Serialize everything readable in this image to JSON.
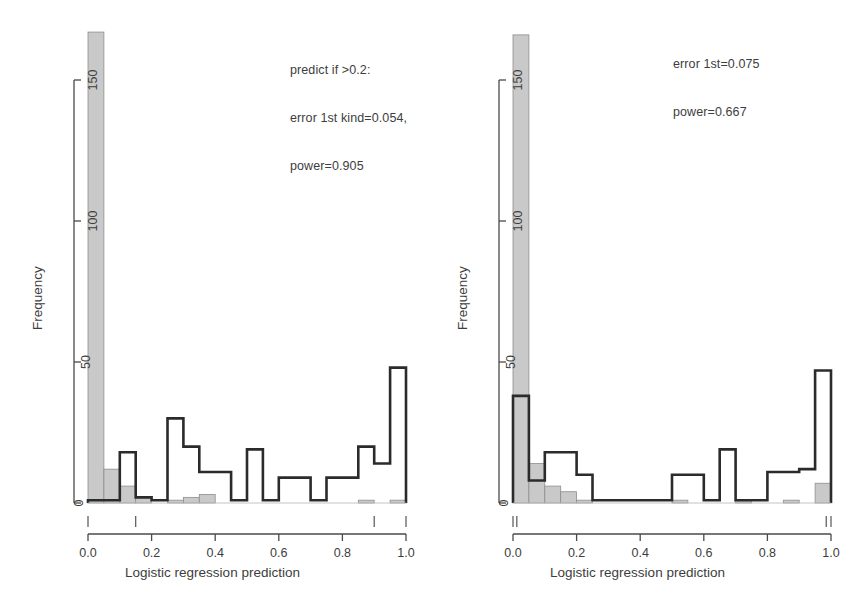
{
  "figure": {
    "width": 850,
    "height": 616,
    "background": "#ffffff",
    "outline_color": "#2b2b2b",
    "fill_color": "#c9c9c9",
    "text_color": "#3d3d3d"
  },
  "panels": [
    {
      "id": "left",
      "xlabel": "Logistic regression prediction",
      "ylabel": "Frequency",
      "annotation_lines": [
        "predict if >0.2:",
        "error 1st kind=0.054,",
        "power=0.905"
      ],
      "xticks": [
        "0.0",
        "0.2",
        "0.4",
        "0.6",
        "0.8",
        "1.0"
      ],
      "yticks": [
        "0",
        "50",
        "100",
        "150"
      ]
    },
    {
      "id": "right",
      "xlabel": "Logistic regression prediction",
      "ylabel": "Frequency",
      "annotation_lines": [
        "error 1st=0.075",
        "power=0.667"
      ],
      "xticks": [
        "0.0",
        "0.2",
        "0.4",
        "0.6",
        "0.8",
        "1.0"
      ],
      "yticks": [
        "0",
        "50",
        "100",
        "150"
      ]
    }
  ],
  "chart_data": [
    {
      "type": "bar",
      "panel": "left",
      "title": "",
      "xlabel": "Logistic regression prediction",
      "ylabel": "Frequency",
      "xlim": [
        0.0,
        1.0
      ],
      "ylim": [
        0,
        170
      ],
      "xticks": [
        0.0,
        0.2,
        0.4,
        0.6,
        0.8,
        1.0
      ],
      "yticks": [
        0,
        50,
        100,
        150
      ],
      "grid": false,
      "legend": "none",
      "bin_width": 0.05,
      "bin_starts": [
        0.0,
        0.05,
        0.1,
        0.15,
        0.2,
        0.25,
        0.3,
        0.35,
        0.4,
        0.45,
        0.5,
        0.55,
        0.6,
        0.65,
        0.7,
        0.75,
        0.8,
        0.85,
        0.9,
        0.95
      ],
      "series": [
        {
          "name": "negatives (grey filled)",
          "style": "filled-grey",
          "values": [
            167,
            12,
            6,
            2,
            0,
            1,
            2,
            3,
            0,
            0,
            0,
            0,
            0,
            0,
            0,
            0,
            0,
            1,
            0,
            1
          ]
        },
        {
          "name": "positives (black outline)",
          "style": "outline-black",
          "values": [
            1,
            1,
            18,
            2,
            1,
            30,
            20,
            11,
            11,
            1,
            19,
            1,
            9,
            9,
            1,
            9,
            9,
            20,
            14,
            48
          ]
        }
      ],
      "rug_marks": [
        0.0,
        0.15,
        0.9,
        1.0
      ],
      "annotations": [
        {
          "text": "predict if >0.2:",
          "x": 0.44,
          "y": 162
        },
        {
          "text": "error 1st kind=0.054,",
          "x": 0.44,
          "y": 155
        },
        {
          "text": "power=0.905",
          "x": 0.44,
          "y": 148
        }
      ]
    },
    {
      "type": "bar",
      "panel": "right",
      "title": "",
      "xlabel": "Logistic regression prediction",
      "ylabel": "Frequency",
      "xlim": [
        0.0,
        1.0
      ],
      "ylim": [
        0,
        170
      ],
      "xticks": [
        0.0,
        0.2,
        0.4,
        0.6,
        0.8,
        1.0
      ],
      "yticks": [
        0,
        50,
        100,
        150
      ],
      "grid": false,
      "legend": "none",
      "bin_width": 0.05,
      "bin_starts": [
        0.0,
        0.05,
        0.1,
        0.15,
        0.2,
        0.25,
        0.3,
        0.35,
        0.4,
        0.45,
        0.5,
        0.55,
        0.6,
        0.65,
        0.7,
        0.75,
        0.8,
        0.85,
        0.9,
        0.95
      ],
      "series": [
        {
          "name": "negatives (grey filled)",
          "style": "filled-grey",
          "values": [
            166,
            14,
            6,
            4,
            1,
            0,
            0,
            0,
            0,
            0,
            1,
            0,
            0,
            0,
            1,
            0,
            0,
            1,
            0,
            7
          ]
        },
        {
          "name": "positives (black outline)",
          "style": "outline-black",
          "values": [
            38,
            8,
            18,
            18,
            10,
            1,
            1,
            1,
            1,
            1,
            10,
            10,
            1,
            19,
            1,
            1,
            11,
            11,
            12,
            47
          ]
        }
      ],
      "rug_marks": [
        0.0,
        0.012,
        0.985,
        1.0
      ],
      "annotations": [
        {
          "text": "error 1st=0.075",
          "x": 0.58,
          "y": 164
        },
        {
          "text": "power=0.667",
          "x": 0.58,
          "y": 157
        }
      ]
    }
  ]
}
